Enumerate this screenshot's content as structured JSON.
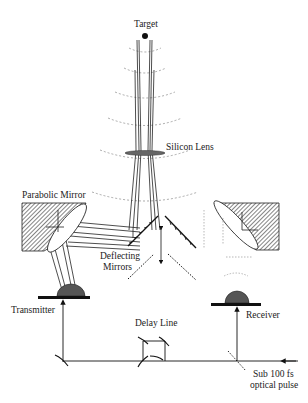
{
  "diagram": {
    "labels": {
      "target": "Target",
      "silicon_lens": "Silicon Lens",
      "parabolic_mirror": "Parabolic Mirror",
      "deflecting_1": "Deflecting",
      "deflecting_2": "Mirrors",
      "transmitter": "Transmitter",
      "receiver": "Receiver",
      "delay_line": "Delay Line",
      "pulse_1": "Sub 100 fs",
      "pulse_2": "optical pulse"
    },
    "colors": {
      "ink": "#1a1a1a",
      "hatch": "#555555",
      "lens": "#666666",
      "dome": "#555555",
      "wavefront": "#888888"
    }
  }
}
